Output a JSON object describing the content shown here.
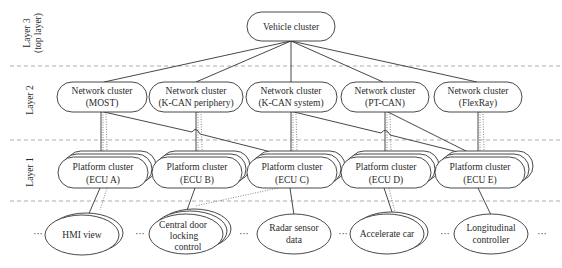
{
  "layers": [
    {
      "id": "layer3",
      "label_line1": "Layer 3",
      "label_line2": "(top layer)"
    },
    {
      "id": "layer2",
      "label_line1": "Layer 2"
    },
    {
      "id": "layer1",
      "label_line1": "Layer 1"
    }
  ],
  "vehicle_cluster": {
    "label": "Vehicle cluster"
  },
  "network_clusters": [
    {
      "line1": "Network cluster",
      "line2": "(MOST)"
    },
    {
      "line1": "Network cluster",
      "line2": "(K-CAN periphery)"
    },
    {
      "line1": "Network cluster",
      "line2": "(K-CAN system)"
    },
    {
      "line1": "Network cluster",
      "line2": "(PT-CAN)"
    },
    {
      "line1": "Network cluster",
      "line2": "(FlexRay)"
    }
  ],
  "platform_clusters": [
    {
      "line1": "Platform cluster",
      "line2": "(ECU A)"
    },
    {
      "line1": "Platform cluster",
      "line2": "(ECU B)"
    },
    {
      "line1": "Platform cluster",
      "line2": "(ECU C)"
    },
    {
      "line1": "Platform cluster",
      "line2": "(ECU D)"
    },
    {
      "line1": "Platform cluster",
      "line2": "(ECU E)"
    }
  ],
  "functions": [
    {
      "line1": "HMI view"
    },
    {
      "line1": "Central door",
      "line2": "locking",
      "line3": "control"
    },
    {
      "line1": "Radar sensor",
      "line2": "data"
    },
    {
      "line1": "Accelerate car"
    },
    {
      "line1": "Longitudinal",
      "line2": "controller"
    }
  ],
  "ellipsis": "···"
}
